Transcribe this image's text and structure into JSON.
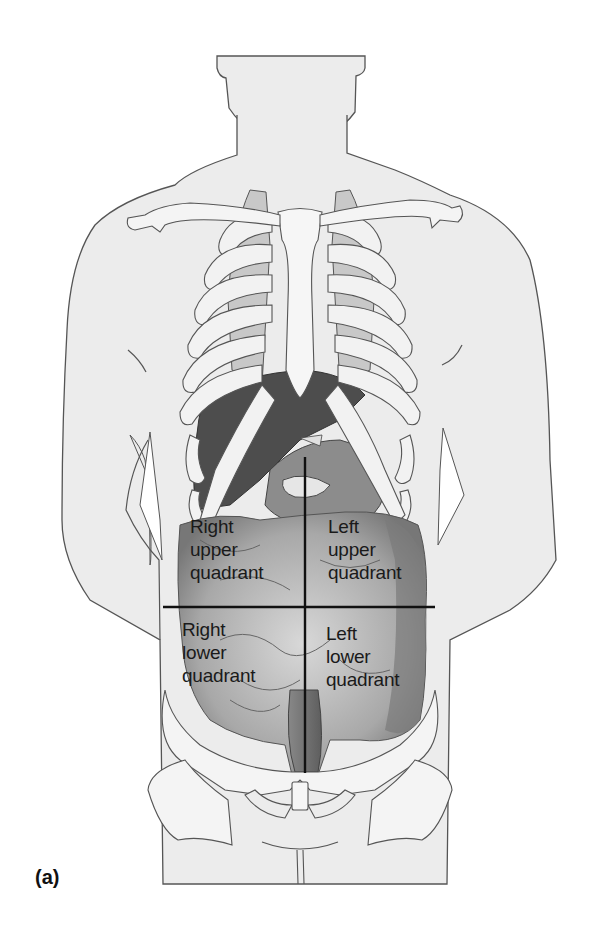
{
  "figure": {
    "panel_label": "(a)",
    "colors": {
      "skin_fill": "#ececec",
      "outline": "#555555",
      "bone_fill": "#f3f3f3",
      "organ_dark": "#4a4a4a",
      "organ_mid": "#8a8a8a",
      "divider_line": "#111111",
      "label_text": "#1a1a1a"
    },
    "quadrants": [
      {
        "id": "ruq",
        "label": "Right\nupper\nquadrant"
      },
      {
        "id": "luq",
        "label": "Left\nupper\nquadrant"
      },
      {
        "id": "rlq",
        "label": "Right\nlower\nquadrant"
      },
      {
        "id": "llq",
        "label": "Left\nlower\nquadrant"
      }
    ],
    "dividers": {
      "vertical": {
        "x": 305,
        "y1": 457,
        "y2": 773
      },
      "horizontal": {
        "y": 607,
        "x1": 163,
        "x2": 435
      }
    }
  }
}
